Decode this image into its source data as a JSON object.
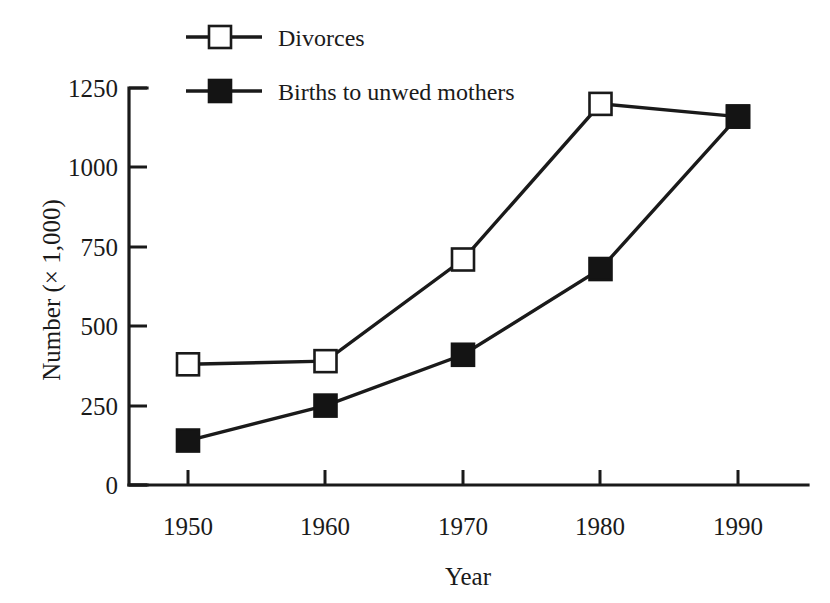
{
  "chart_data": {
    "type": "line",
    "title": "",
    "xlabel": "Year",
    "ylabel": "Number (× 1,000)",
    "x": [
      1950,
      1960,
      1970,
      1980,
      1990
    ],
    "xtick_labels": [
      "1950",
      "1960",
      "1970",
      "1980",
      "1990"
    ],
    "ytick_labels": [
      "0",
      "250",
      "500",
      "750",
      "1000",
      "1250"
    ],
    "yticks": [
      0,
      250,
      500,
      750,
      1000,
      1250
    ],
    "xlim": [
      1945,
      1995
    ],
    "ylim": [
      0,
      1250
    ],
    "grid": false,
    "legend_position": "top-left",
    "series": [
      {
        "name": "Divorces",
        "marker": "open-square",
        "color": "#1a1a1a",
        "values": [
          380,
          390,
          710,
          1200,
          1160
        ]
      },
      {
        "name": "Births to unwed mothers",
        "marker": "filled-square",
        "color": "#141414",
        "values": [
          140,
          250,
          410,
          680,
          1160
        ]
      }
    ]
  },
  "legend": {
    "entries": [
      {
        "label": "Divorces"
      },
      {
        "label": "Births to unwed mothers"
      }
    ]
  },
  "axes": {
    "y_title": "Number (× 1,000)",
    "x_title": "Year",
    "y_tick_0": "0",
    "y_tick_1": "250",
    "y_tick_2": "500",
    "y_tick_3": "750",
    "y_tick_4": "1000",
    "y_tick_5": "1250",
    "x_tick_0": "1950",
    "x_tick_1": "1960",
    "x_tick_2": "1970",
    "x_tick_3": "1980",
    "x_tick_4": "1990"
  },
  "colors": {
    "ink": "#1a1a1a",
    "background": "#ffffff",
    "marker_fill": "#141414",
    "marker_open_fill": "#ffffff"
  }
}
